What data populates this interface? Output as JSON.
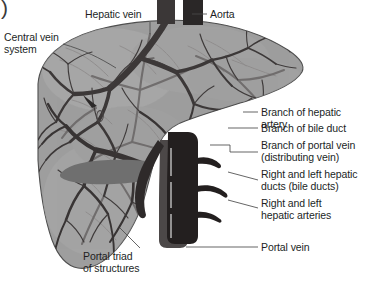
{
  "figure": {
    "corner_mark": ")",
    "colors": {
      "liver_body": "#9b9b9b",
      "liver_body_light": "#a8a8a8",
      "liver_outline": "#4a4a4a",
      "vessel_dark": "#3a3636",
      "vessel_mid": "#5d5a5a",
      "vessel_light": "#7d7a7a",
      "trunk_dark": "#2b2828",
      "band_grey": "#6f6f6f",
      "label_text": "#221f1f",
      "leader_line": "#4a4a4a",
      "background": "#ffffff"
    }
  },
  "labels": {
    "central_vein_system": "Central vein\nsystem",
    "hepatic_vein": "Hepatic vein",
    "aorta": "Aorta",
    "branch_hepatic_artery": "Branch of hepatic\nartery",
    "branch_bile_duct": "Branch of bile duct",
    "branch_portal_vein": "Branch of portal vein\n(distributing vein)",
    "hepatic_ducts": "Right and left hepatic\nducts (bile ducts)",
    "hepatic_arteries": "Right and left\nhepatic arteries",
    "portal_vein": "Portal vein",
    "portal_triad": "Portal triad\nof structures"
  }
}
